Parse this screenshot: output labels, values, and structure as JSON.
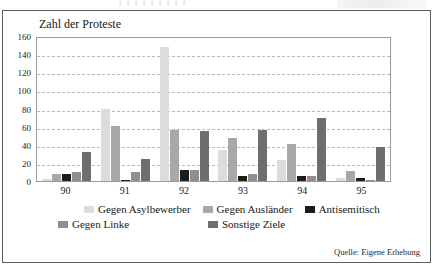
{
  "scan": {
    "top_artifact_text": "1 1 1 1 1 1 1 1 1"
  },
  "figure": {
    "axis_title": "Zahl der Proteste",
    "source_note": "Quelle: Eigene Erhebung"
  },
  "chart_data": {
    "type": "bar",
    "title": "Zahl der Proteste",
    "xlabel": "",
    "ylabel": "Zahl der Proteste",
    "categories": [
      "90",
      "91",
      "92",
      "93",
      "94",
      "95"
    ],
    "ylim": [
      0,
      160
    ],
    "yticks": [
      160,
      140,
      120,
      100,
      80,
      60,
      40,
      20,
      0
    ],
    "grid": true,
    "legend_position": "bottom",
    "series": [
      {
        "name": "Gegen Asylbewerber",
        "color": "#dcdcdc",
        "values": [
          2,
          80,
          148,
          34,
          23,
          3
        ]
      },
      {
        "name": "Gegen Ausländer",
        "color": "#a8a8a8",
        "values": [
          8,
          61,
          56,
          48,
          41,
          11
        ]
      },
      {
        "name": "Antisemitisch",
        "color": "#1c1c1c",
        "values": [
          8,
          1,
          12,
          6,
          6,
          3
        ]
      },
      {
        "name": "Gegen Linke",
        "color": "#8f8f8f",
        "values": [
          10,
          10,
          12,
          8,
          5,
          1
        ]
      },
      {
        "name": "Sonstige Ziele",
        "color": "#6e6e6e",
        "values": [
          32,
          24,
          55,
          56,
          70,
          37
        ]
      }
    ]
  }
}
